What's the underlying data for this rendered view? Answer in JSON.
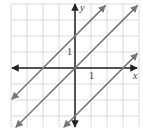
{
  "chart_data": {
    "type": "line",
    "title": "",
    "xlabel": "x",
    "ylabel": "y",
    "tick_labels": {
      "x": [
        "1"
      ],
      "y": [
        "1"
      ]
    },
    "grid": true,
    "xlim": [
      -4,
      4
    ],
    "ylim": [
      -4,
      4
    ],
    "series": [
      {
        "name": "y = x + 2",
        "slope": 1,
        "intercept": 2,
        "x": [
          -4,
          2
        ],
        "y": [
          -2,
          4
        ]
      },
      {
        "name": "y = x",
        "slope": 1,
        "intercept": 0,
        "x": [
          -4,
          4
        ],
        "y": [
          -4,
          4
        ]
      },
      {
        "name": "y = x - 3",
        "slope": 1,
        "intercept": -3,
        "x": [
          -1,
          4
        ],
        "y": [
          -4,
          1
        ]
      }
    ]
  },
  "labels": {
    "x_axis": "x",
    "y_axis": "y",
    "x_tick": "1",
    "y_tick": "1"
  },
  "colors": {
    "grid": "#d9d9d9",
    "axes": "#222222",
    "lines": "#777777"
  }
}
